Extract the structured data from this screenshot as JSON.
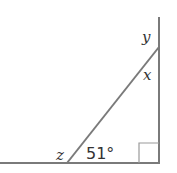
{
  "diagram": {
    "labels": {
      "y": "y",
      "x": "x",
      "z": "z",
      "angle": "51°"
    },
    "right_angle_marker": true,
    "colors": {
      "line": "#7a7a7a",
      "text": "#333333"
    }
  }
}
